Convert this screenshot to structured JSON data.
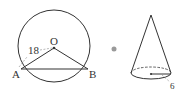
{
  "left_figure": {
    "description": "circle with center O and chord AB",
    "labels": {
      "center": "O",
      "point_a": "A",
      "point_b": "B",
      "radius": "18"
    }
  },
  "arrow": {
    "icon": "arrow-dot-icon"
  },
  "right_figure": {
    "description": "cone",
    "labels": {
      "base_radius": "6"
    }
  },
  "colors": {
    "stroke": "#333333",
    "arrow": "#9a9a9a",
    "background": "#ffffff"
  }
}
